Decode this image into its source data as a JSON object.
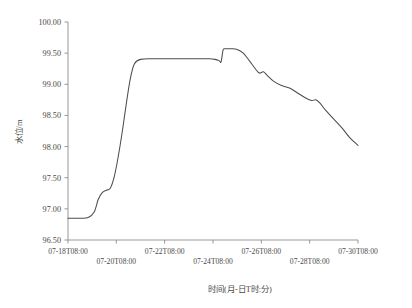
{
  "chart_data": {
    "type": "line",
    "title": "",
    "xlabel": "时间(月-日T时:分)",
    "ylabel": "水位/m",
    "ylim": [
      96.5,
      100.0
    ],
    "yticks": [
      "96.50",
      "97.00",
      "97.50",
      "98.00",
      "98.50",
      "99.00",
      "99.50",
      "100.00"
    ],
    "ytick_values": [
      96.5,
      97.0,
      97.5,
      98.0,
      98.5,
      99.0,
      99.5,
      100.0
    ],
    "xticks": [
      "07-18T08:00",
      "07-20T08:00",
      "07-22T08:00",
      "07-24T08:00",
      "07-26T08:00",
      "07-28T08:00",
      "07-30T08:00"
    ],
    "xtick_label_rows": [
      0,
      1,
      0,
      1,
      0,
      1,
      0
    ],
    "xlim": [
      "07-18T08:00",
      "07-30T08:00"
    ],
    "grid": false,
    "legend": "none",
    "series": [
      {
        "name": "水位",
        "color": "#4d4d4d",
        "x": [
          "07-18T08:00",
          "07-18T20:00",
          "07-19T04:00",
          "07-19T10:00",
          "07-19T14:00",
          "07-19T18:00",
          "07-19T22:00",
          "07-20T02:00",
          "07-20T06:00",
          "07-20T10:00",
          "07-20T14:00",
          "07-20T18:00",
          "07-20T22:00",
          "07-21T02:00",
          "07-21T08:00",
          "07-21T20:00",
          "07-22T08:00",
          "07-22T20:00",
          "07-23T08:00",
          "07-23T20:00",
          "07-24T04:00",
          "07-24T10:00",
          "07-24T14:00",
          "07-24T16:00",
          "07-24T18:00",
          "07-24T20:00",
          "07-25T02:00",
          "07-25T08:00",
          "07-25T14:00",
          "07-25T20:00",
          "07-26T02:00",
          "07-26T06:00",
          "07-26T10:00",
          "07-26T14:00",
          "07-26T20:00",
          "07-27T04:00",
          "07-27T12:00",
          "07-27T20:00",
          "07-28T04:00",
          "07-28T10:00",
          "07-28T14:00",
          "07-28T18:00",
          "07-29T00:00",
          "07-29T08:00",
          "07-29T16:00",
          "07-30T00:00",
          "07-30T08:00"
        ],
        "y": [
          96.85,
          96.85,
          96.86,
          96.95,
          97.15,
          97.26,
          97.3,
          97.33,
          97.52,
          97.85,
          98.25,
          98.7,
          99.1,
          99.33,
          99.4,
          99.41,
          99.41,
          99.41,
          99.41,
          99.41,
          99.41,
          99.4,
          99.38,
          99.36,
          99.55,
          99.57,
          99.57,
          99.56,
          99.5,
          99.38,
          99.25,
          99.18,
          99.2,
          99.14,
          99.05,
          98.98,
          98.94,
          98.86,
          98.78,
          98.74,
          98.75,
          98.7,
          98.58,
          98.44,
          98.3,
          98.14,
          98.02
        ]
      }
    ],
    "annotations": [
      {
        "label": "initial-flat-level",
        "value": 96.85
      },
      {
        "label": "plateau-level",
        "value": 99.41
      },
      {
        "label": "peak-level",
        "value": 99.57
      },
      {
        "label": "final-level",
        "value": 98.02
      }
    ]
  },
  "axes": {
    "y_title": "水位/m",
    "x_title": "时间(月-日T时:分)"
  },
  "colors": {
    "series": "#4d4d4d",
    "axis": "#8c8c8c",
    "text": "#4a4a4a",
    "background": "#ffffff"
  }
}
